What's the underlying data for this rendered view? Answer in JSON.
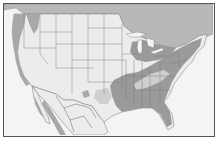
{
  "map": {
    "title": "",
    "regions": [
      "United States",
      "Mexico",
      "Canada"
    ],
    "legend": [],
    "shading": {
      "range_primary": "#9a9a9a",
      "range_secondary": "#cfcfcf",
      "canada": "#b8b8b8",
      "land": "#ececec",
      "water": "#f4f4f4",
      "border": "#555555"
    }
  }
}
